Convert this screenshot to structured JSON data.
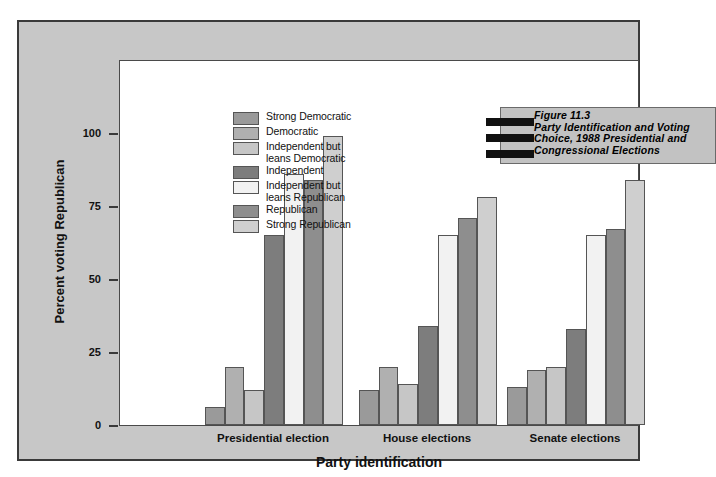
{
  "figure": {
    "number": "Figure 11.3",
    "title_lines": "Figure 11.3\nParty Identification and Voting\nChoice, 1988 Presidential and\nCongressional Elections",
    "bar_count": 3
  },
  "legend": {
    "items": [
      {
        "label": "Strong Democratic",
        "color": "#9a9a9a"
      },
      {
        "label": "Democratic",
        "color": "#b0b0b0"
      },
      {
        "label": "Independent but\nleans Democratic",
        "color": "#c6c6c6"
      },
      {
        "label": "Independent",
        "color": "#7d7d7d"
      },
      {
        "label": "Independent but\nleans Republican",
        "color": "#f2f2f2"
      },
      {
        "label": "Republican",
        "color": "#8e8e8e"
      },
      {
        "label": "Strong Republican",
        "color": "#cfcfcf"
      }
    ]
  },
  "chart_data": {
    "type": "bar",
    "title": "Party Identification and Voting Choice, 1988 Presidential and Congressional Elections",
    "xlabel": "Party identification",
    "ylabel": "Percent voting Republican",
    "ylim": [
      0,
      100
    ],
    "yticks": [
      0,
      25,
      50,
      75,
      100
    ],
    "ytick_labels": [
      "0",
      "25",
      "50",
      "75",
      "100"
    ],
    "grid": false,
    "legend_position": "upper-left-inside",
    "categories": [
      "Presidential election",
      "House elections",
      "Senate elections"
    ],
    "series": [
      {
        "name": "Strong Democratic",
        "color": "#9a9a9a",
        "values": [
          6,
          12,
          13
        ]
      },
      {
        "name": "Democratic",
        "color": "#b0b0b0",
        "values": [
          20,
          20,
          19
        ]
      },
      {
        "name": "Independent but leans Democratic",
        "color": "#c6c6c6",
        "values": [
          12,
          14,
          20
        ]
      },
      {
        "name": "Independent",
        "color": "#7d7d7d",
        "values": [
          65,
          34,
          33
        ]
      },
      {
        "name": "Independent but leans Republican",
        "color": "#f2f2f2",
        "values": [
          86,
          65,
          65
        ]
      },
      {
        "name": "Republican",
        "color": "#8e8e8e",
        "values": [
          84,
          71,
          67
        ]
      },
      {
        "name": "Strong Republican",
        "color": "#cfcfcf",
        "values": [
          99,
          78,
          84
        ]
      }
    ]
  },
  "colors": {
    "panel_background": "#c7c7c7",
    "plot_background": "#ffffff",
    "frame_border": "#3a3a3a",
    "title_box": "#c2c2c2",
    "title_bar": "#111111",
    "text": "#111111"
  }
}
